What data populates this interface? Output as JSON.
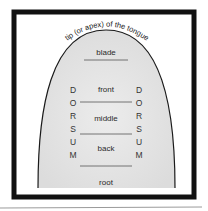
{
  "diagram": {
    "title": "tip (or apex) of the tongue",
    "regions": [
      {
        "label": "blade"
      },
      {
        "label": "front"
      },
      {
        "label": "middle"
      },
      {
        "label": "back"
      },
      {
        "label": "root"
      }
    ],
    "side_label_left": [
      "D",
      "O",
      "R",
      "S",
      "U",
      "M"
    ],
    "side_label_right": [
      "D",
      "O",
      "R",
      "S",
      "U",
      "M"
    ],
    "side_word": "DORSUM",
    "colors": {
      "frame": "#111111",
      "tongue_fill": "#e6e6e6",
      "outline": "#1a1a1a",
      "divider": "#555555",
      "background": "#ffffff"
    }
  }
}
